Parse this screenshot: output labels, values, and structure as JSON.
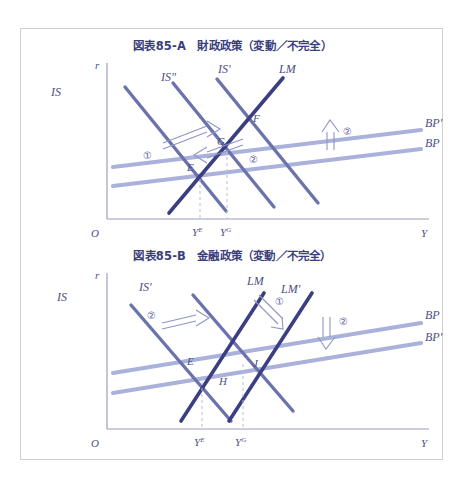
{
  "figure": {
    "frame_border_color": "#d0d0d0",
    "background": "#ffffff"
  },
  "colors": {
    "dark_curve": "#3b3f82",
    "mid_curve": "#6b72ac",
    "light_curve": "#aab2dc",
    "title_text": "#3b3f7a",
    "label_text": "#4a4f86",
    "axis": "#9aa0b8",
    "dashed": "#b8bcd8"
  },
  "panels": [
    {
      "id": "A",
      "title": "図表85-A　財政政策（変動／不完全）",
      "axes": {
        "y_label": "r",
        "x_label": "Y",
        "origin_label": "O"
      },
      "tick_labels": [
        {
          "base": "Y",
          "sup": "E"
        },
        {
          "base": "Y",
          "sup": "G"
        }
      ],
      "curve_labels": [
        {
          "name": "IS",
          "text": "IS"
        },
        {
          "name": "IS-double-prime",
          "text": "ISʺ"
        },
        {
          "name": "IS-prime",
          "text": "ISʹ"
        },
        {
          "name": "LM",
          "text": "LM"
        },
        {
          "name": "BP-prime",
          "text": "BPʹ"
        },
        {
          "name": "BP",
          "text": "BP"
        }
      ],
      "point_labels": [
        "E",
        "F",
        "G"
      ],
      "annotations": [
        {
          "name": "shift-step-1",
          "marker": "①",
          "direction": "up-right"
        },
        {
          "name": "shift-step-2",
          "marker": "②",
          "direction": "down-left"
        },
        {
          "name": "bp-shift-step-2",
          "marker": "②",
          "direction": "up"
        }
      ]
    },
    {
      "id": "B",
      "title": "図表85-B　金融政策（変動／不完全）",
      "axes": {
        "y_label": "r",
        "x_label": "Y",
        "origin_label": "O"
      },
      "tick_labels": [
        {
          "base": "Y",
          "sup": "E"
        },
        {
          "base": "Y",
          "sup": "G"
        }
      ],
      "curve_labels": [
        {
          "name": "IS",
          "text": "IS"
        },
        {
          "name": "IS-prime",
          "text": "ISʹ"
        },
        {
          "name": "LM",
          "text": "LM"
        },
        {
          "name": "LM-prime",
          "text": "LMʹ"
        },
        {
          "name": "BP",
          "text": "BP"
        },
        {
          "name": "BP-prime",
          "text": "BPʹ"
        }
      ],
      "point_labels": [
        "E",
        "H",
        "J"
      ],
      "annotations": [
        {
          "name": "lm-shift-step-1",
          "marker": "①",
          "direction": "down-right"
        },
        {
          "name": "is-shift-step-2",
          "marker": "②",
          "direction": "right"
        },
        {
          "name": "bp-shift-step-2",
          "marker": "②",
          "direction": "down"
        }
      ]
    }
  ]
}
